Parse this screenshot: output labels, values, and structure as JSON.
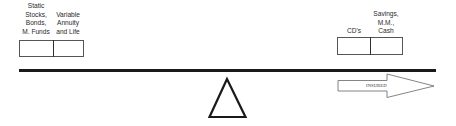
{
  "left_group": {
    "stocks_label": [
      "Static",
      "Stocks,",
      "Bonds,",
      "M. Funds"
    ],
    "annuity_label": [
      "Variable",
      "Annuity",
      "and Life"
    ]
  },
  "right_group": {
    "cds_label": [
      "CD's"
    ],
    "savings_label": [
      "Savings,",
      "M.M.,",
      "Cash"
    ]
  },
  "arrow": {
    "label": "INSURED",
    "direction": "right"
  },
  "fulcrum": {
    "shape": "triangle-outline"
  },
  "colors": {
    "beam": "#1a1a1a",
    "box_border": "#555555",
    "text": "#2a2a2a",
    "background": "#ffffff"
  }
}
